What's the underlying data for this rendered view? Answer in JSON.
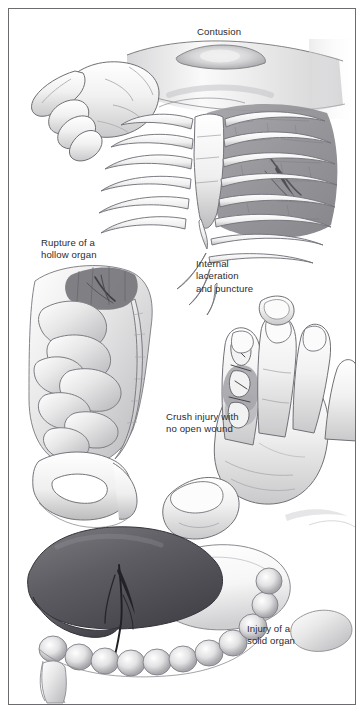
{
  "figure": {
    "background_color": "#ffffff",
    "border_color": "#6b6b70",
    "text_color": "#2b2b2e",
    "width": 364,
    "height": 713
  },
  "labels": {
    "contusion": "Contusion",
    "hollow_organ": "Rupture of a\nhollow organ",
    "internal_laceration": "Internal\nlaceration\nand puncture",
    "crush_injury": "Crush injury with\nno open wound",
    "solid_organ": "Injury of a\nsolid organ"
  },
  "illustrations": [
    {
      "name": "forearm-contusion",
      "description": "Relaxed hand and forearm in profile with a raised swollen bruise on the dorsal forearm",
      "label": "Contusion",
      "tone": "light-gray pencil shading"
    },
    {
      "name": "ribcage-laceration",
      "description": "Anterior ribcage with sternum; shaded lung tissue visible between ribs with a puncture tear",
      "label": "Internal laceration and puncture",
      "tone": "mid-gray stippled tissue"
    },
    {
      "name": "intestines-rupture",
      "description": "Coiled small and large intestine over the pelvic bone with a dark ruptured segment at upper right",
      "label": "Rupture of a hollow organ",
      "tone": "light-gray with dark rupture site"
    },
    {
      "name": "hand-crush-injury",
      "description": "Open hand, palm away, with the index finger showing a crushed fracture of the phalanges and no break in the skin",
      "label": "Crush injury with no open wound",
      "tone": "light-gray pencil shading"
    },
    {
      "name": "liver-laceration",
      "description": "Dark liver with a vertical laceration tear, adjacent stomach and loops of large intestine below",
      "label": "Injury of a solid organ",
      "tone": "dark-gray liver, light stomach"
    }
  ]
}
